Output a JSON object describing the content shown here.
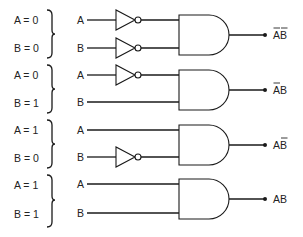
{
  "diagram": {
    "title": "",
    "groups": [
      {
        "cond_a": "A = 0",
        "cond_b": "B = 0",
        "input_a": "A",
        "input_b": "B",
        "invert_a": true,
        "invert_b": true,
        "output_label": "AB",
        "bar_a": true,
        "bar_b": true
      },
      {
        "cond_a": "A = 0",
        "cond_b": "B = 1",
        "input_a": "A",
        "input_b": "B",
        "invert_a": true,
        "invert_b": false,
        "output_label": "AB",
        "bar_a": true,
        "bar_b": false
      },
      {
        "cond_a": "A = 1",
        "cond_b": "B = 0",
        "input_a": "A",
        "input_b": "B",
        "invert_a": false,
        "invert_b": true,
        "output_label": "AB",
        "bar_a": false,
        "bar_b": true
      },
      {
        "cond_a": "A = 1",
        "cond_b": "B = 1",
        "input_a": "A",
        "input_b": "B",
        "invert_a": false,
        "invert_b": false,
        "output_label": "AB",
        "bar_a": false,
        "bar_b": false
      }
    ],
    "gate_type": "AND",
    "inverter_type": "NOT"
  }
}
